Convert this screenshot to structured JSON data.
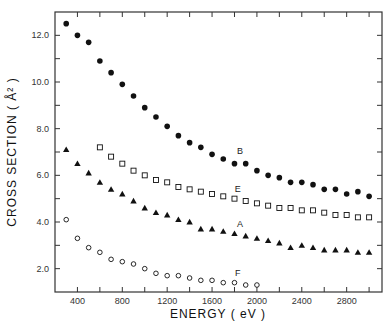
{
  "chart_data": {
    "type": "scatter",
    "title": "",
    "xlabel": "ENERGY ( eV )",
    "ylabel": "CROSS SECTION ( Å² )",
    "xlim": [
      200,
      3115
    ],
    "ylim": [
      1.0,
      13.0
    ],
    "x_ticks": [
      400,
      800,
      1200,
      1600,
      2000,
      2400,
      2800
    ],
    "x_tick_labels": [
      "400",
      "800",
      "1200",
      "1600",
      "2000",
      "2400",
      "2800"
    ],
    "x_minor_ticks": [
      600,
      1000,
      1400,
      1800,
      2200,
      2600,
      3000
    ],
    "y_ticks": [
      2.0,
      4.0,
      6.0,
      8.0,
      10.0,
      12.0
    ],
    "y_tick_labels": [
      "2.0",
      "4.0",
      "6.0",
      "8.0",
      "10.0",
      "12.0"
    ],
    "y_minor_ticks": [
      3.0,
      5.0,
      7.0,
      9.0,
      11.0
    ],
    "grid": false,
    "legend": "inline labels",
    "series": [
      {
        "name": "B",
        "marker": "filled-circle",
        "label_pos": [
          1850,
          6.9
        ],
        "x": [
          300,
          400,
          500,
          600,
          700,
          800,
          900,
          1000,
          1100,
          1200,
          1300,
          1400,
          1500,
          1600,
          1700,
          1800,
          1900,
          2000,
          2100,
          2200,
          2300,
          2400,
          2500,
          2600,
          2700,
          2800,
          2900,
          3000
        ],
        "values": [
          12.5,
          12.0,
          11.7,
          10.9,
          10.4,
          9.9,
          9.4,
          8.9,
          8.5,
          8.1,
          7.7,
          7.4,
          7.2,
          6.9,
          6.7,
          6.5,
          6.5,
          6.2,
          6.0,
          5.9,
          5.7,
          5.7,
          5.6,
          5.4,
          5.4,
          5.2,
          5.3,
          5.1
        ]
      },
      {
        "name": "E",
        "marker": "open-square",
        "label_pos": [
          1830,
          5.3
        ],
        "x": [
          600,
          700,
          800,
          900,
          1000,
          1100,
          1200,
          1300,
          1400,
          1500,
          1600,
          1700,
          1800,
          1900,
          2000,
          2100,
          2200,
          2300,
          2400,
          2500,
          2600,
          2700,
          2800,
          2900,
          3000
        ],
        "values": [
          7.2,
          6.8,
          6.5,
          6.2,
          6.0,
          5.8,
          5.7,
          5.5,
          5.4,
          5.3,
          5.2,
          5.1,
          5.0,
          4.9,
          4.8,
          4.7,
          4.6,
          4.6,
          4.5,
          4.5,
          4.4,
          4.3,
          4.3,
          4.2,
          4.2
        ]
      },
      {
        "name": "A",
        "marker": "filled-triangle",
        "label_pos": [
          1850,
          3.8
        ],
        "x": [
          300,
          400,
          500,
          600,
          700,
          800,
          900,
          1000,
          1100,
          1200,
          1300,
          1400,
          1500,
          1600,
          1700,
          1800,
          1900,
          2000,
          2100,
          2200,
          2300,
          2400,
          2500,
          2600,
          2700,
          2800,
          2900,
          3000
        ],
        "values": [
          7.1,
          6.5,
          6.1,
          5.7,
          5.4,
          5.2,
          4.9,
          4.6,
          4.4,
          4.3,
          4.1,
          4.0,
          3.7,
          3.7,
          3.6,
          3.5,
          3.4,
          3.3,
          3.2,
          3.1,
          2.9,
          3.0,
          2.9,
          2.8,
          2.8,
          2.8,
          2.7,
          2.7
        ]
      },
      {
        "name": "F",
        "marker": "open-circle",
        "label_pos": [
          1830,
          1.7
        ],
        "x": [
          300,
          400,
          500,
          600,
          700,
          800,
          900,
          1000,
          1100,
          1200,
          1300,
          1400,
          1500,
          1600,
          1700,
          1800,
          1900,
          2000
        ],
        "values": [
          4.1,
          3.3,
          2.9,
          2.7,
          2.4,
          2.3,
          2.2,
          2.0,
          1.8,
          1.7,
          1.7,
          1.6,
          1.5,
          1.5,
          1.4,
          1.4,
          1.3,
          1.3
        ]
      }
    ]
  },
  "colors": {
    "ink": "#111111",
    "axis": "#333333",
    "background": "#ffffff"
  }
}
